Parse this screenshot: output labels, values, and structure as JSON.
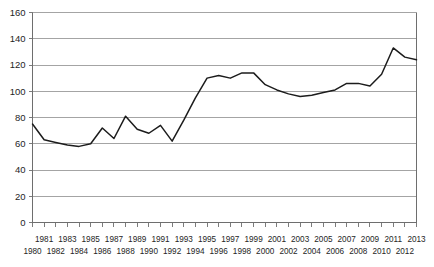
{
  "chart_data": {
    "type": "line",
    "title": "",
    "subtitle": "",
    "xlabel": "",
    "ylabel": "",
    "xlim": [
      1980,
      2013
    ],
    "ylim": [
      0,
      160
    ],
    "ytick_step": 20,
    "yticks": [
      0,
      20,
      40,
      60,
      80,
      100,
      120,
      140,
      160
    ],
    "ytick_labels": [
      "0",
      "20",
      "40",
      "60",
      "80",
      "100",
      "120",
      "140",
      "160"
    ],
    "grid": true,
    "legend": "none",
    "x": [
      1980,
      1981,
      1982,
      1983,
      1984,
      1985,
      1986,
      1987,
      1988,
      1989,
      1990,
      1991,
      1992,
      1993,
      1994,
      1995,
      1996,
      1997,
      1998,
      1999,
      2000,
      2001,
      2002,
      2003,
      2004,
      2005,
      2006,
      2007,
      2008,
      2009,
      2010,
      2011,
      2012,
      2013
    ],
    "xtick_labels_top_row": [
      "1981",
      "1983",
      "1985",
      "1987",
      "1989",
      "1991",
      "1993",
      "1995",
      "1997",
      "1999",
      "2001",
      "2003",
      "2005",
      "2007",
      "2009",
      "2011",
      "2013"
    ],
    "xtick_labels_bottom_row": [
      "1980",
      "1982",
      "1984",
      "1986",
      "1988",
      "1990",
      "1992",
      "1994",
      "1996",
      "1998",
      "2000",
      "2002",
      "2004",
      "2006",
      "2008",
      "2010",
      "2012"
    ],
    "values": [
      75,
      63,
      61,
      59,
      58,
      60,
      72,
      64,
      81,
      71,
      68,
      74,
      62,
      78,
      95,
      110,
      112,
      110,
      114,
      114,
      105,
      101,
      98,
      96,
      97,
      99,
      101,
      106,
      106,
      104,
      113,
      133,
      126,
      124
    ],
    "series": [
      {
        "name": "series-1",
        "color": "#1c1c1c",
        "values": [
          75,
          63,
          61,
          59,
          58,
          60,
          72,
          64,
          81,
          71,
          68,
          74,
          62,
          78,
          95,
          110,
          112,
          110,
          114,
          114,
          105,
          101,
          98,
          96,
          97,
          99,
          101,
          106,
          106,
          104,
          113,
          133,
          126,
          124
        ]
      }
    ],
    "colors": {
      "line": "#1c1c1c",
      "grid": "#9a9a9a",
      "axis": "#6e6e6e",
      "text": "#252525",
      "background": "#ffffff"
    }
  }
}
